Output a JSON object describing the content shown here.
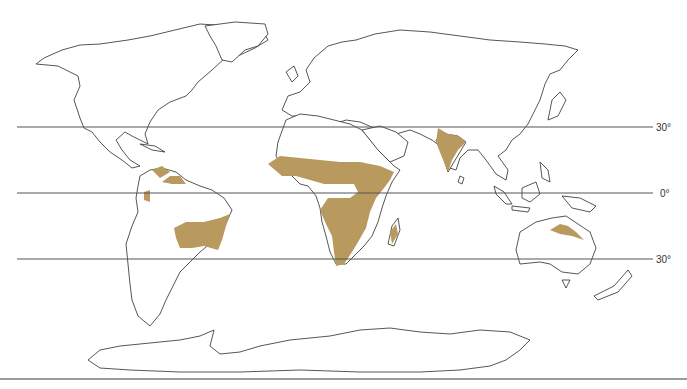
{
  "map": {
    "subject": "savanna distribution",
    "colors": {
      "savanna": "#b99a5e",
      "coastline": "#2b2b2b",
      "latitude_line": "#555555",
      "background": "#ffffff"
    },
    "latitude_lines": [
      {
        "label": "30°",
        "y": 127
      },
      {
        "label": "0°",
        "y": 193
      },
      {
        "label": "30°",
        "y": 259
      }
    ],
    "savanna_regions": [
      "Central America / northern South America",
      "Brazil",
      "Sub-Saharan Africa (Sahel to southern Africa)",
      "Madagascar",
      "India",
      "Northern Australia"
    ]
  }
}
